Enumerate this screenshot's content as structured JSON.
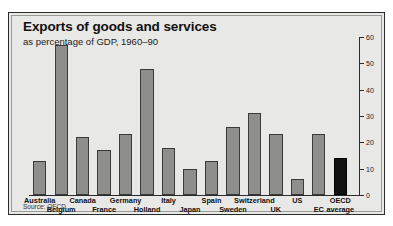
{
  "chart": {
    "title": "Exports of goods and services",
    "subtitle": "as percentage of GDP, 1960–90",
    "source": "Source: OECD"
  },
  "chart_data": {
    "type": "bar",
    "title": "Exports of goods and services",
    "subtitle": "as percentage of GDP, 1960–90",
    "xlabel": "",
    "ylabel": "",
    "ylim": [
      0,
      60
    ],
    "yticks": [
      0,
      10,
      20,
      30,
      40,
      50,
      60
    ],
    "ytick_labels": [
      "0",
      "10",
      "20",
      "30",
      "40",
      "50",
      "60"
    ],
    "axis_position": "right",
    "grid": false,
    "legend": false,
    "source": "Source: OECD",
    "bar_color": "#8e8e8c",
    "highlight_color": "#111111",
    "categories": [
      "Australia",
      "Belgium",
      "Canada",
      "France",
      "Germany",
      "Holland",
      "Italy",
      "Japan",
      "Spain",
      "Sweden",
      "Switzerland",
      "UK",
      "US",
      "EC average",
      "OECD average"
    ],
    "values": [
      13,
      57,
      22,
      17,
      23,
      48,
      18,
      10,
      13,
      26,
      31,
      23,
      6,
      23,
      14
    ],
    "label_rows": [
      0,
      1,
      0,
      1,
      0,
      1,
      0,
      1,
      0,
      1,
      0,
      1,
      0,
      1,
      0
    ],
    "highlight_index": 14
  }
}
